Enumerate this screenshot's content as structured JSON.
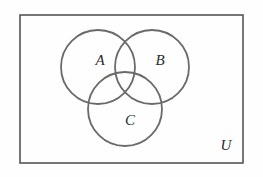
{
  "figure": {
    "type": "venn-diagram",
    "width": 263,
    "height": 177,
    "background_color": "#fefefe"
  },
  "universe": {
    "label": "U",
    "label_x": 226,
    "label_y": 147,
    "rect": {
      "x": 20,
      "y": 15,
      "width": 223,
      "height": 148
    },
    "stroke_color": "#555555",
    "stroke_width": 1.6
  },
  "sets": [
    {
      "label": "A",
      "cx": 98,
      "cy": 67,
      "r": 37,
      "label_x": 100,
      "label_y": 62,
      "stroke_color": "#6a6a6a",
      "stroke_width": 1.8
    },
    {
      "label": "B",
      "cx": 152,
      "cy": 67,
      "r": 37,
      "label_x": 160,
      "label_y": 62,
      "stroke_color": "#6a6a6a",
      "stroke_width": 1.8
    },
    {
      "label": "C",
      "cx": 125,
      "cy": 109,
      "r": 37,
      "label_x": 130,
      "label_y": 122,
      "stroke_color": "#6a6a6a",
      "stroke_width": 1.8
    }
  ]
}
